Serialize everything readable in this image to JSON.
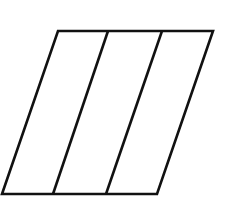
{
  "diagram": {
    "stroke_color": "#111111",
    "background": "#ffffff",
    "outer": {
      "top_left": [
        58,
        31
      ],
      "top_right": [
        213,
        31
      ],
      "bottom_right": [
        157,
        194
      ],
      "bottom_left": [
        2,
        194
      ]
    },
    "dividers": [
      {
        "top": [
          108,
          31
        ],
        "bottom": [
          53,
          194
        ]
      },
      {
        "top": [
          162,
          31
        ],
        "bottom": [
          106,
          194
        ]
      }
    ]
  }
}
